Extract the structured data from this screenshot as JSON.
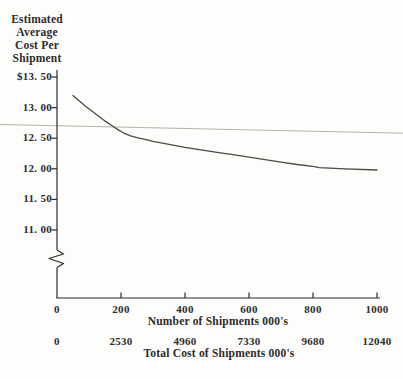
{
  "figure": {
    "y_axis_title_lines": [
      "Estimated",
      "Average",
      "Cost Per",
      "Shipment"
    ],
    "y_tick_labels": [
      "$13. 50",
      "13. 00",
      "12. 50",
      "12. 00",
      "11. 50",
      "11. 00"
    ],
    "x_shipments_tick_labels": [
      "0",
      "200",
      "400",
      "600",
      "800",
      "1000"
    ],
    "x_total_cost_tick_labels": [
      "0",
      "2530",
      "4960",
      "7330",
      "9680",
      "12040"
    ],
    "x_shipments_label": "Number of Shipments 000's",
    "x_total_cost_label": "Total Cost of Shipments 000's"
  },
  "colors": {
    "ink": "#2e2b28",
    "curve": "#4d4a47",
    "reference_line": "#b5b2ae",
    "background": "#fdfdfc"
  },
  "chart_data": {
    "type": "line",
    "title": "Estimated Average Cost Per Shipment",
    "xlabel": "Number of Shipments 000's",
    "xlabel_secondary": "Total Cost of Shipments 000's",
    "ylabel": "Estimated Average Cost Per Shipment ($)",
    "x_ticks_shipments": [
      0,
      200,
      400,
      600,
      800,
      1000
    ],
    "x_ticks_total_cost": [
      0,
      2530,
      4960,
      7330,
      9680,
      12040
    ],
    "y_ticks": [
      13.5,
      13.0,
      12.5,
      12.0,
      11.5,
      11.0
    ],
    "xlim": [
      0,
      1000
    ],
    "ylim": [
      11.0,
      13.5
    ],
    "y_axis_break": true,
    "grid": false,
    "legend": false,
    "reference_line_y": 12.6,
    "series": [
      {
        "name": "Estimated average cost per shipment",
        "x": [
          50,
          70,
          90,
          110,
          130,
          150,
          170,
          190,
          210,
          230,
          250,
          275,
          300,
          350,
          400,
          450,
          500,
          550,
          600,
          650,
          700,
          750,
          800,
          820,
          900,
          1000
        ],
        "y": [
          13.2,
          13.11,
          13.02,
          12.94,
          12.86,
          12.78,
          12.71,
          12.64,
          12.58,
          12.54,
          12.51,
          12.48,
          12.45,
          12.4,
          12.35,
          12.31,
          12.27,
          12.23,
          12.19,
          12.15,
          12.11,
          12.07,
          12.04,
          12.02,
          12.0,
          11.98
        ]
      }
    ]
  }
}
